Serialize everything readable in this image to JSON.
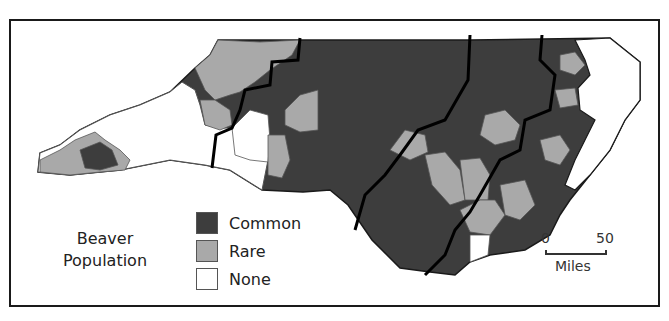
{
  "map": {
    "title": "Beaver Population",
    "region": "North Carolina counties",
    "colors": {
      "common": "#3d3d3d",
      "rare": "#a9a9a9",
      "none": "#ffffff",
      "border": "#1a1a1a"
    }
  },
  "legend": {
    "title_line1": "Beaver",
    "title_line2": "Population",
    "items": [
      {
        "label": "Common",
        "color": "#3d3d3d"
      },
      {
        "label": "Rare",
        "color": "#a9a9a9"
      },
      {
        "label": "None",
        "color": "#ffffff"
      }
    ]
  },
  "scale": {
    "start": "0",
    "end": "50",
    "unit": "Miles"
  }
}
